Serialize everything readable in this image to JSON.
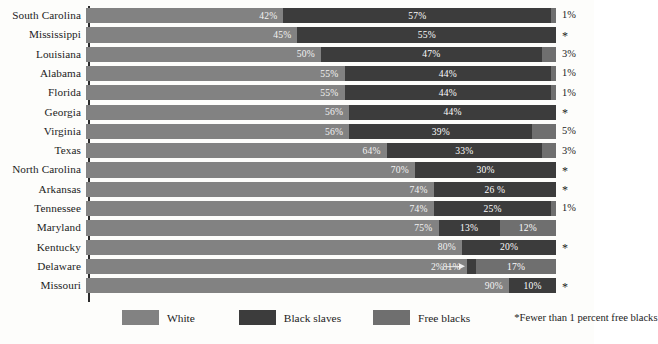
{
  "chart_data": {
    "type": "bar",
    "subtype": "stacked-horizontal-100",
    "title": "",
    "xlabel": "",
    "ylabel": "",
    "xlim": [
      0,
      100
    ],
    "grid": false,
    "legend_position": "bottom",
    "categories": [
      "South Carolina",
      "Mississippi",
      "Louisiana",
      "Alabama",
      "Florida",
      "Georgia",
      "Virginia",
      "Texas",
      "North Carolina",
      "Arkansas",
      "Tennessee",
      "Maryland",
      "Kentucky",
      "Delaware",
      "Missouri"
    ],
    "series": [
      {
        "name": "White",
        "color": "#828282",
        "values": [
          42,
          45,
          50,
          55,
          55,
          56,
          56,
          64,
          70,
          74,
          74,
          75,
          80,
          81,
          90
        ]
      },
      {
        "name": "Black slaves",
        "color": "#3c3c3c",
        "values": [
          57,
          55,
          47,
          44,
          44,
          44,
          39,
          33,
          30,
          26,
          25,
          13,
          20,
          2,
          10
        ]
      },
      {
        "name": "Free blacks",
        "color": "#6f6f6f",
        "values": [
          1,
          0.5,
          3,
          1,
          1,
          0.5,
          5,
          3,
          0.5,
          0.5,
          1,
          12,
          0.5,
          17,
          0.5
        ]
      }
    ],
    "labels": {
      "white": [
        "42%",
        "45%",
        "50%",
        "55%",
        "55%",
        "56%",
        "56%",
        "64%",
        "70%",
        "74%",
        "74%",
        "75%",
        "80%",
        "81%",
        "90%"
      ],
      "slaves": [
        "57%",
        "55%",
        "47%",
        "44%",
        "44%",
        "44%",
        "39%",
        "33%",
        "30%",
        "26 %",
        "25%",
        "13%",
        "20%",
        "2%",
        "10%"
      ],
      "free": [
        "1%",
        "*",
        "3%",
        "1%",
        "1%",
        "*",
        "5%",
        "3%",
        "*",
        "*",
        "1%",
        "12%",
        "*",
        "17%",
        "*"
      ]
    },
    "annotations": [
      {
        "row": "Delaware",
        "text": "2%",
        "kind": "arrow-callout"
      }
    ],
    "footnote": "*Fewer than 1 percent free blacks"
  },
  "rows": [
    {
      "state": "South Carolina",
      "white": 42,
      "white_label": "42%",
      "slaves": 57,
      "slaves_label": "57%",
      "free": 1,
      "free_label": "1%",
      "free_inside": false
    },
    {
      "state": "Mississippi",
      "white": 45,
      "white_label": "45%",
      "slaves": 55,
      "slaves_label": "55%",
      "free": 0,
      "free_label": "*",
      "free_inside": false
    },
    {
      "state": "Louisiana",
      "white": 50,
      "white_label": "50%",
      "slaves": 47,
      "slaves_label": "47%",
      "free": 3,
      "free_label": "3%",
      "free_inside": false
    },
    {
      "state": "Alabama",
      "white": 55,
      "white_label": "55%",
      "slaves": 44,
      "slaves_label": "44%",
      "free": 1,
      "free_label": "1%",
      "free_inside": false
    },
    {
      "state": "Florida",
      "white": 55,
      "white_label": "55%",
      "slaves": 44,
      "slaves_label": "44%",
      "free": 1,
      "free_label": "1%",
      "free_inside": false
    },
    {
      "state": "Georgia",
      "white": 56,
      "white_label": "56%",
      "slaves": 44,
      "slaves_label": "44%",
      "free": 0,
      "free_label": "*",
      "free_inside": false
    },
    {
      "state": "Virginia",
      "white": 56,
      "white_label": "56%",
      "slaves": 39,
      "slaves_label": "39%",
      "free": 5,
      "free_label": "5%",
      "free_inside": false
    },
    {
      "state": "Texas",
      "white": 64,
      "white_label": "64%",
      "slaves": 33,
      "slaves_label": "33%",
      "free": 3,
      "free_label": "3%",
      "free_inside": false
    },
    {
      "state": "North Carolina",
      "white": 70,
      "white_label": "70%",
      "slaves": 30,
      "slaves_label": "30%",
      "free": 0,
      "free_label": "*",
      "free_inside": false
    },
    {
      "state": "Arkansas",
      "white": 74,
      "white_label": "74%",
      "slaves": 26,
      "slaves_label": "26 %",
      "free": 0,
      "free_label": "*",
      "free_inside": false
    },
    {
      "state": "Tennessee",
      "white": 74,
      "white_label": "74%",
      "slaves": 25,
      "slaves_label": "25%",
      "free": 1,
      "free_label": "1%",
      "free_inside": false
    },
    {
      "state": "Maryland",
      "white": 75,
      "white_label": "75%",
      "slaves": 13,
      "slaves_label": "13%",
      "free": 12,
      "free_label": "12%",
      "free_inside": true
    },
    {
      "state": "Kentucky",
      "white": 80,
      "white_label": "80%",
      "slaves": 20,
      "slaves_label": "20%",
      "free": 0,
      "free_label": "*",
      "free_inside": false
    },
    {
      "state": "Delaware",
      "white": 81,
      "white_label": "81%",
      "slaves": 2,
      "slaves_label": "2%",
      "free": 17,
      "free_label": "17%",
      "free_inside": true
    },
    {
      "state": "Missouri",
      "white": 90,
      "white_label": "90%",
      "slaves": 10,
      "slaves_label": "10%",
      "free": 0,
      "free_label": "*",
      "free_inside": false
    }
  ],
  "legend": {
    "items": [
      {
        "label": "White",
        "color": "#828282"
      },
      {
        "label": "Black slaves",
        "color": "#3c3c3c"
      },
      {
        "label": "Free blacks",
        "color": "#6f6f6f"
      }
    ]
  },
  "footnote": {
    "text": "*Fewer than 1 percent free blacks"
  }
}
